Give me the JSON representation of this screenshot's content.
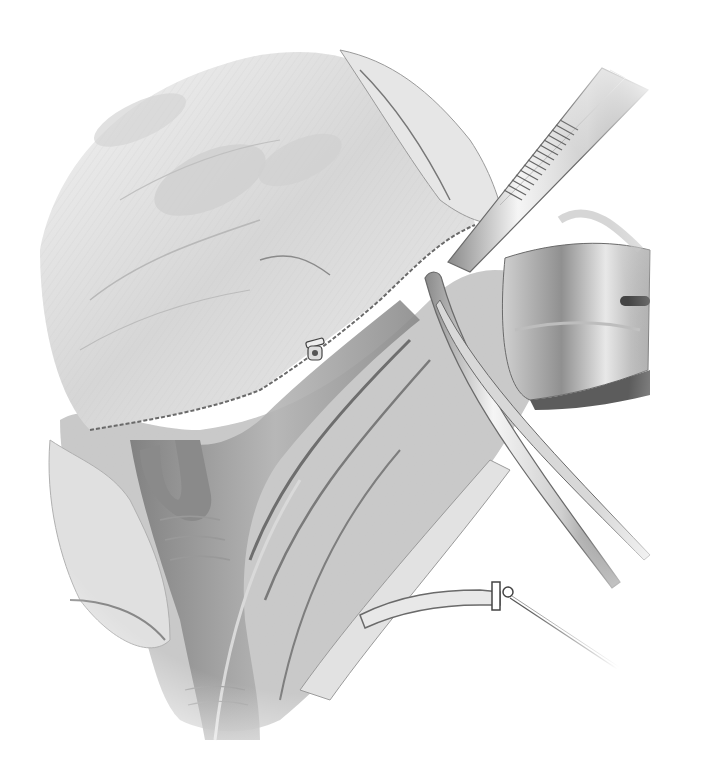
{
  "illustration": {
    "style": "grayscale surgical pencil illustration",
    "background": "#ffffff",
    "elements": [
      {
        "name": "tissue-flap",
        "description": "Large fibrous tissue flap, upper-left"
      },
      {
        "name": "forceps",
        "description": "Serrated tissue forceps, upper-right, diagonal"
      },
      {
        "name": "retractor",
        "description": "Metal retractor blade with slot, right side"
      },
      {
        "name": "curved-clamp",
        "description": "Long curved clamp, center-right, diagonal"
      },
      {
        "name": "vessel-bundle",
        "description": "Branching blood vessels, center to bottom"
      },
      {
        "name": "ligature",
        "description": "Tied vessel with suture thread trailing down-right"
      },
      {
        "name": "clip",
        "description": "Small surgical clip, center"
      }
    ],
    "colors": {
      "paper": "#ffffff",
      "tissue_light": "#e6e6e6",
      "tissue_mid": "#bdbdbd",
      "vessel": "#9a9a9a",
      "vessel_dark": "#6e6e6e",
      "metal_light": "#f2f2f2",
      "metal_dark": "#7a7a7a",
      "line": "#555555"
    }
  }
}
